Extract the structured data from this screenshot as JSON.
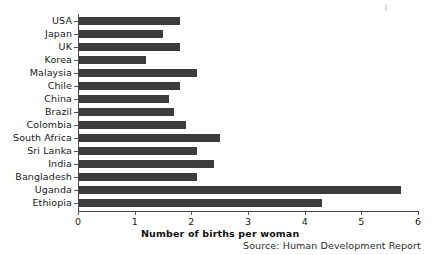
{
  "chart_data": {
    "type": "bar",
    "orientation": "horizontal",
    "title": "",
    "xlabel": "Number of births per woman",
    "ylabel": "",
    "xlim": [
      0,
      6
    ],
    "xticks": [
      "0",
      "1",
      "2",
      "3",
      "4",
      "5",
      "6"
    ],
    "grid": false,
    "legend": null,
    "bar_color": "#3c3c3c",
    "categories": [
      "USA",
      "Japan",
      "UK",
      "Korea",
      "Malaysia",
      "Chile",
      "China",
      "Brazil",
      "Colombia",
      "South Africa",
      "Sri Lanka",
      "India",
      "Bangladesh",
      "Uganda",
      "Ethiopia"
    ],
    "values": [
      1.8,
      1.5,
      1.8,
      1.2,
      2.1,
      1.8,
      1.6,
      1.7,
      1.9,
      2.5,
      2.1,
      2.4,
      2.1,
      5.7,
      4.3
    ],
    "annotations": [
      "Source: Human Development Report"
    ]
  },
  "source": {
    "text": "Source: Human Development Report"
  }
}
